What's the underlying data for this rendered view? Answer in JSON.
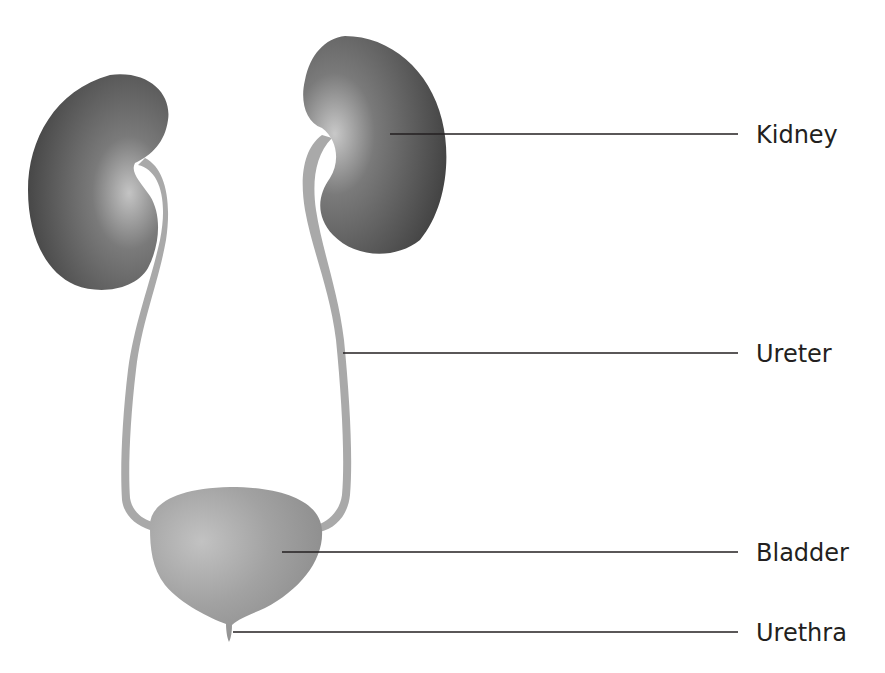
{
  "diagram": {
    "labels": [
      {
        "id": "kidney",
        "text": "Kidney"
      },
      {
        "id": "ureter",
        "text": "Ureter"
      },
      {
        "id": "bladder",
        "text": "Bladder"
      },
      {
        "id": "urethra",
        "text": "Urethra"
      }
    ],
    "colors": {
      "kidney_dark": "#4a4a4a",
      "kidney_light": "#b5b5b5",
      "ureter": "#a8a8a8",
      "bladder": "#9c9c9c",
      "leader_line": "#231f20",
      "text": "#231f20"
    }
  }
}
